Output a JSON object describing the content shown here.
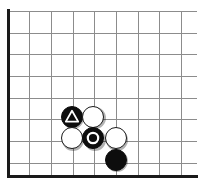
{
  "board": {
    "width": 204,
    "height": 185,
    "grid_spacing": 21.7,
    "line_color": "#8c8c8c",
    "edge_color": "#1a1a1a",
    "background_color": "#ffffff",
    "vertical_lines": [
      7.5,
      29.2,
      50.8,
      72.5,
      94.2,
      115.8,
      137.5,
      159.2,
      181.0
    ],
    "horizontal_lines": [
      11.0,
      32.7,
      54.3,
      76.0,
      97.7,
      119.3,
      141.0,
      162.7,
      176.5
    ],
    "edges": [
      {
        "name": "left-edge",
        "orientation": "vertical",
        "x": 7.0,
        "y": 9.0,
        "length": 169
      },
      {
        "name": "bottom-edge",
        "orientation": "horizontal",
        "x": 7.0,
        "y": 175.0,
        "length": 191
      }
    ]
  },
  "stones": [
    {
      "id": "black-triangle",
      "color": "black",
      "color_hex": "#0d0d0d",
      "cx": 71.7,
      "cy": 116.5,
      "diameter": 22,
      "mark": "triangle",
      "mark_color": "#ffffff",
      "label": "marked black stone (triangle)"
    },
    {
      "id": "white-upper-right",
      "color": "white",
      "color_hex": "#ffffff",
      "cx": 93.3,
      "cy": 116.5,
      "diameter": 22,
      "mark": "none",
      "mark_color": "",
      "label": "white stone"
    },
    {
      "id": "white-lower-left",
      "color": "white",
      "color_hex": "#ffffff",
      "cx": 71.7,
      "cy": 138.2,
      "diameter": 22,
      "mark": "none",
      "mark_color": "",
      "label": "white stone"
    },
    {
      "id": "black-circle",
      "color": "black",
      "color_hex": "#0d0d0d",
      "cx": 93.3,
      "cy": 138.2,
      "diameter": 22,
      "mark": "circle",
      "mark_color": "#ffffff",
      "label": "marked black stone (circle)"
    },
    {
      "id": "white-right",
      "color": "white",
      "color_hex": "#ffffff",
      "cx": 115.8,
      "cy": 138.2,
      "diameter": 22,
      "mark": "none",
      "mark_color": "",
      "label": "white stone"
    },
    {
      "id": "black-bottom",
      "color": "black",
      "color_hex": "#0d0d0d",
      "cx": 115.8,
      "cy": 159.8,
      "diameter": 22,
      "mark": "none",
      "mark_color": "",
      "label": "black stone"
    }
  ]
}
